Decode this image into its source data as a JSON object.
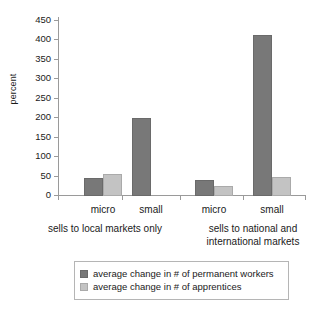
{
  "chart_data": {
    "type": "bar",
    "title": "",
    "xlabel": "",
    "ylabel": "percent",
    "ylim": [
      0,
      450
    ],
    "ytick_step": 50,
    "yticks": [
      450,
      400,
      350,
      300,
      250,
      200,
      150,
      100,
      50,
      0
    ],
    "grid": false,
    "legend_position": "bottom",
    "categories": [
      "micro",
      "small",
      "micro",
      "small"
    ],
    "groups": [
      {
        "label": "sells to local markets only",
        "categories": [
          "micro",
          "small"
        ]
      },
      {
        "label": "sells to national and international markets",
        "label_line1": "sells to national and",
        "label_line2": "international markets",
        "categories": [
          "micro",
          "small"
        ]
      }
    ],
    "series": [
      {
        "name": "average change in # of permanent workers",
        "color": "#787878",
        "values": [
          46,
          200,
          40,
          415
        ]
      },
      {
        "name": "average change in # of apprentices",
        "color": "#c3c3c3",
        "values": [
          57,
          0,
          27,
          48
        ]
      }
    ]
  },
  "legend": {
    "items": [
      {
        "label": "average change in # of permanent workers",
        "swatch": "dark"
      },
      {
        "label": "average change in # of apprentices",
        "swatch": "light"
      }
    ]
  }
}
